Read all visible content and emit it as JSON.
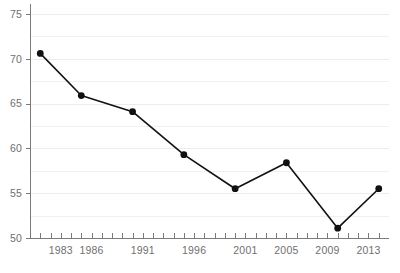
{
  "chart_data": {
    "type": "line",
    "title": "",
    "subtitle": "",
    "xlabel": "",
    "ylabel": "",
    "xlim": [
      1980,
      2015
    ],
    "ylim": [
      50,
      75
    ],
    "grid": true,
    "legend": false,
    "legend_position": "none",
    "y_ticks": [
      50,
      55,
      60,
      65,
      70,
      75
    ],
    "y_tick_labels": [
      "50",
      "55",
      "60",
      "65",
      "70",
      "75"
    ],
    "y_minor_step": 2.5,
    "x_ticks": [
      1981,
      1982,
      1983,
      1984,
      1985,
      1986,
      1987,
      1988,
      1989,
      1990,
      1991,
      1992,
      1993,
      1994,
      1995,
      1996,
      1997,
      1998,
      1999,
      2000,
      2001,
      2002,
      2003,
      2004,
      2005,
      2006,
      2007,
      2008,
      2009,
      2010,
      2011,
      2012,
      2013,
      2014,
      2015
    ],
    "x_tick_labels": [
      "1983",
      "1986",
      "1991",
      "1996",
      "2001",
      "2005",
      "2009",
      "2013"
    ],
    "x_tick_label_years": [
      1983,
      1986,
      1991,
      1996,
      2001,
      2005,
      2009,
      2013
    ],
    "marker": "circle",
    "marker_color": "#111111",
    "line_color": "#111111",
    "x": [
      1981,
      1985,
      1990,
      1995,
      2000,
      2005,
      2010,
      2014
    ],
    "values": [
      70.6,
      65.9,
      64.1,
      59.3,
      55.5,
      58.4,
      51.1,
      55.5
    ],
    "series": [
      {
        "name": "series-1",
        "x": [
          1981,
          1985,
          1990,
          1995,
          2000,
          2005,
          2010,
          2014
        ],
        "values": [
          70.6,
          65.9,
          64.1,
          59.3,
          55.5,
          58.4,
          51.1,
          55.5
        ]
      }
    ],
    "annotations": []
  },
  "captions": {
    "top_clipped": "",
    "bottom_clipped": ""
  },
  "colors": {
    "line": "#111111",
    "marker": "#111111",
    "axis": "#7a7a7a",
    "gridline": "#f0f0f0",
    "tick_label": "#6f6f6f",
    "background": "#ffffff"
  }
}
